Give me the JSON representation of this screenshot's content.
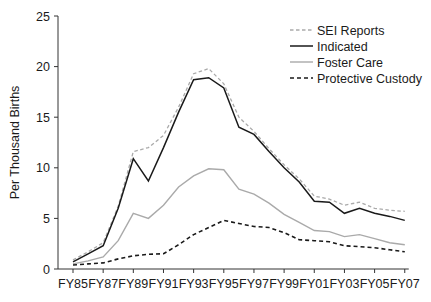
{
  "chart_data": {
    "type": "line",
    "title": "",
    "xlabel": "",
    "ylabel": "Per Thousand Births",
    "ylim": [
      0,
      25
    ],
    "yticks": [
      0,
      5,
      10,
      15,
      20,
      25
    ],
    "grid": false,
    "legend_position": "upper right",
    "x": [
      "FY85",
      "FY86",
      "FY87",
      "FY88",
      "FY89",
      "FY90",
      "FY91",
      "FY92",
      "FY93",
      "FY94",
      "FY95",
      "FY96",
      "FY97",
      "FY98",
      "FY99",
      "FY00",
      "FY01",
      "FY02",
      "FY03",
      "FY04",
      "FY05",
      "FY06",
      "FY07"
    ],
    "xtick_labels": [
      "FY85",
      "FY87",
      "FY89",
      "FY91",
      "FY93",
      "FY95",
      "FY97",
      "FY99",
      "FY01",
      "FY03",
      "FY05",
      "FY07"
    ],
    "series": [
      {
        "name": "SEI Reports",
        "style": "dashed",
        "color": "#aaaaaa",
        "values": [
          0.9,
          1.7,
          2.6,
          6.2,
          11.6,
          12.0,
          13.2,
          16.0,
          19.3,
          19.8,
          18.3,
          15.0,
          13.6,
          11.9,
          10.3,
          8.9,
          7.2,
          6.9,
          6.3,
          6.6,
          6.0,
          5.8,
          5.7
        ]
      },
      {
        "name": "Indicated",
        "style": "solid",
        "color": "#1a1a1a",
        "values": [
          0.7,
          1.5,
          2.3,
          6.0,
          10.9,
          8.7,
          12.0,
          15.5,
          18.7,
          18.9,
          17.9,
          14.0,
          13.3,
          11.6,
          10.0,
          8.6,
          6.7,
          6.6,
          5.5,
          6.0,
          5.5,
          5.2,
          4.8
        ]
      },
      {
        "name": "Foster Care",
        "style": "solid",
        "color": "#aaaaaa",
        "values": [
          0.5,
          0.8,
          1.2,
          2.8,
          5.5,
          5.0,
          6.3,
          8.1,
          9.2,
          9.9,
          9.8,
          7.9,
          7.4,
          6.5,
          5.4,
          4.6,
          3.8,
          3.7,
          3.2,
          3.4,
          3.0,
          2.6,
          2.4
        ]
      },
      {
        "name": "Protective Custody",
        "style": "dashed",
        "color": "#1a1a1a",
        "values": [
          0.4,
          0.5,
          0.6,
          1.0,
          1.3,
          1.45,
          1.5,
          2.4,
          3.4,
          4.1,
          4.8,
          4.5,
          4.2,
          4.1,
          3.6,
          2.9,
          2.8,
          2.7,
          2.3,
          2.2,
          2.1,
          1.9,
          1.7
        ]
      }
    ]
  }
}
